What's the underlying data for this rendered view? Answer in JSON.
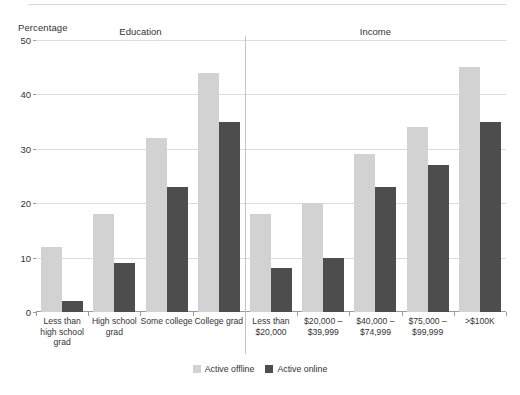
{
  "axis_title": "Percentage",
  "legend": {
    "items": [
      {
        "label": "Active offline",
        "color": "#d2d2d2",
        "key": "offline"
      },
      {
        "label": "Active online",
        "color": "#4d4d4d",
        "key": "online"
      }
    ]
  },
  "sections": [
    {
      "label": "Education"
    },
    {
      "label": "Income"
    }
  ],
  "chart_data": {
    "type": "bar",
    "title": "",
    "subtitle": "",
    "xlabel": "",
    "ylabel": "Percentage",
    "ylim": [
      0,
      50
    ],
    "yticks": [
      0,
      10,
      20,
      30,
      40,
      50
    ],
    "ytick_labels": [
      "0",
      "10",
      "20",
      "30",
      "40",
      "50"
    ],
    "grid": true,
    "legend_position": "bottom-center",
    "group_labels": [
      "Education",
      "Income"
    ],
    "categories": [
      "Less than high school grad",
      "High school grad",
      "Some college",
      "College grad",
      "Less than $20,000",
      "$20,000 – $39,999",
      "$40,000 – $74,999",
      "$75,000 – $99,999",
      ">$100K"
    ],
    "category_display": [
      "Less than\nhigh school\ngrad",
      "High school\ngrad",
      "Some college",
      "College grad",
      "Less than\n$20,000",
      "$20,000 –\n$39,999",
      "$40,000 –\n$74,999",
      "$75,000 –\n$99,999",
      ">$100K"
    ],
    "category_group": [
      "Education",
      "Education",
      "Education",
      "Education",
      "Income",
      "Income",
      "Income",
      "Income",
      "Income"
    ],
    "series": [
      {
        "name": "Active offline",
        "color": "#d2d2d2",
        "values": [
          12,
          18,
          32,
          44,
          18,
          20,
          29,
          34,
          45
        ]
      },
      {
        "name": "Active online",
        "color": "#4d4d4d",
        "values": [
          2,
          9,
          23,
          35,
          8,
          10,
          23,
          27,
          35
        ]
      }
    ]
  }
}
